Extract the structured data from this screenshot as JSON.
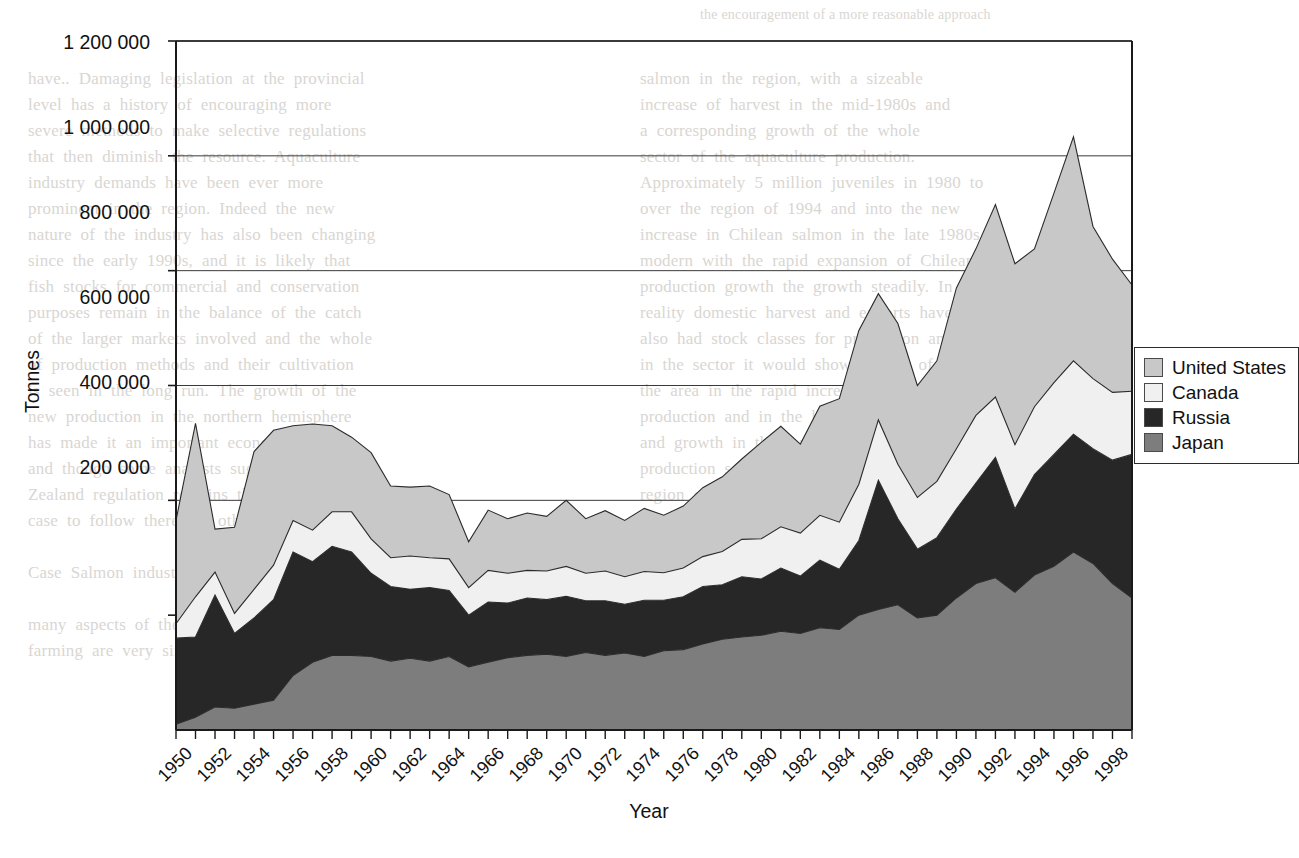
{
  "chart_data": {
    "type": "area",
    "stacked": true,
    "title": "",
    "xlabel": "Year",
    "ylabel": "Tonnes",
    "ylim": [
      0,
      1200000
    ],
    "ytick_labels": [
      "1 200 000",
      "1 000 000",
      "800 000",
      "600 000",
      "400 000",
      "200 000"
    ],
    "ytick_values": [
      1200000,
      1000000,
      800000,
      600000,
      400000,
      200000
    ],
    "grid": true,
    "legend_position": "right-upper",
    "x": [
      1950,
      1951,
      1952,
      1953,
      1954,
      1955,
      1956,
      1957,
      1958,
      1959,
      1960,
      1961,
      1962,
      1963,
      1964,
      1965,
      1966,
      1967,
      1968,
      1969,
      1970,
      1971,
      1972,
      1973,
      1974,
      1975,
      1976,
      1977,
      1978,
      1979,
      1980,
      1981,
      1982,
      1983,
      1984,
      1985,
      1986,
      1987,
      1988,
      1989,
      1990,
      1991,
      1992,
      1993,
      1994,
      1995,
      1996,
      1997,
      1998,
      1999
    ],
    "xtick_labels": [
      "1950",
      "1952",
      "1954",
      "1956",
      "1958",
      "1960",
      "1962",
      "1964",
      "1966",
      "1968",
      "1970",
      "1972",
      "1974",
      "1976",
      "1978",
      "1980",
      "1982",
      "1984",
      "1986",
      "1988",
      "1990",
      "1992",
      "1994",
      "1996",
      "1998"
    ],
    "series": [
      {
        "name": "Japan",
        "color": "#7d7d7d",
        "values": [
          10000,
          22000,
          40000,
          38000,
          45000,
          52000,
          95000,
          118000,
          130000,
          130000,
          128000,
          120000,
          125000,
          120000,
          128000,
          110000,
          118000,
          126000,
          130000,
          132000,
          128000,
          135000,
          130000,
          134000,
          128000,
          138000,
          140000,
          150000,
          158000,
          162000,
          165000,
          172000,
          168000,
          178000,
          175000,
          200000,
          210000,
          218000,
          195000,
          200000,
          230000,
          255000,
          265000,
          240000,
          270000,
          285000,
          310000,
          290000,
          255000,
          230000
        ]
      },
      {
        "name": "Russia",
        "color": "#272727",
        "values": [
          150000,
          140000,
          195000,
          130000,
          150000,
          175000,
          215000,
          175000,
          190000,
          180000,
          145000,
          130000,
          120000,
          128000,
          115000,
          90000,
          105000,
          95000,
          100000,
          95000,
          105000,
          90000,
          95000,
          85000,
          98000,
          88000,
          92000,
          100000,
          95000,
          105000,
          98000,
          110000,
          100000,
          118000,
          105000,
          130000,
          225000,
          150000,
          120000,
          135000,
          155000,
          175000,
          210000,
          145000,
          175000,
          195000,
          205000,
          200000,
          215000,
          250000
        ]
      },
      {
        "name": "Canada",
        "color": "#f0f0f0",
        "values": [
          25000,
          70000,
          40000,
          35000,
          50000,
          60000,
          55000,
          55000,
          60000,
          70000,
          60000,
          50000,
          58000,
          52000,
          55000,
          48000,
          55000,
          52000,
          48000,
          50000,
          52000,
          48000,
          52000,
          48000,
          50000,
          48000,
          50000,
          52000,
          58000,
          65000,
          70000,
          72000,
          75000,
          78000,
          82000,
          98000,
          105000,
          95000,
          90000,
          98000,
          105000,
          118000,
          105000,
          112000,
          118000,
          125000,
          128000,
          122000,
          118000,
          110000
        ]
      },
      {
        "name": "United States",
        "color": "#c8c8c8",
        "values": [
          180000,
          302000,
          75000,
          150000,
          240000,
          235000,
          165000,
          185000,
          150000,
          130000,
          150000,
          125000,
          120000,
          125000,
          112000,
          80000,
          105000,
          95000,
          100000,
          95000,
          115000,
          95000,
          105000,
          98000,
          110000,
          100000,
          108000,
          120000,
          130000,
          140000,
          168000,
          175000,
          155000,
          190000,
          215000,
          268000,
          220000,
          245000,
          195000,
          210000,
          280000,
          290000,
          335000,
          315000,
          275000,
          330000,
          390000,
          265000,
          232000,
          185000
        ]
      }
    ]
  },
  "legend": {
    "items": [
      {
        "label": "United States",
        "color": "#c8c8c8"
      },
      {
        "label": "Canada",
        "color": "#f0f0f0"
      },
      {
        "label": "Russia",
        "color": "#272727"
      },
      {
        "label": "Japan",
        "color": "#7d7d7d"
      }
    ]
  },
  "page_bleed": {
    "top_line": "the encouragement of a more reasonable approach",
    "col_left": [
      "have..  Damaging  legislation  at  the  provincial",
      "level  has  a  history  of  encouraging  more",
      "severe  methods  to  make  selective  regulations",
      "that  then  diminish  the  resource.  Aquaculture",
      "industry  demands  have  been  ever  more",
      "prominent  in  the  region.  Indeed  the  new",
      "nature  of  the  industry  has  also  been  changing",
      "since  the  early  1990s,  and  it  is  likely  that",
      "fish  stocks  for  commercial  and  conservation",
      "purposes  remain  in  the  balance  of  the  catch",
      "of  the  larger  markets  involved  and  the  whole",
      "of  production  methods  and  their  cultivation",
      "is  seen  in  the  long  run.  The  growth  of  the",
      "new  production  in  the  northern  hemisphere",
      "has  made  it  an  important  economic  sector",
      "and  though  some  analysts  suggest  that  New",
      "Zealand  regulation  remains  the  standard",
      "case  to  follow  there  are  others  who  do  not.",
      "",
      "Case  Salmon  industry  of  Chile",
      "",
      "many  aspects  of  the  history  of  salmonid",
      "farming  are  very  similar  to  that  of  other"
    ],
    "col_right": [
      "salmon  in  the  region,  with  a  sizeable",
      "increase  of  harvest  in  the  mid-1980s  and",
      "a  corresponding  growth  of  the  whole",
      "sector  of  the  aquaculture  production.",
      "Approximately  5  million  juveniles  in  1980  to",
      "over  the  region  of  1994  and  into  the  new",
      "increase  in  Chilean  salmon  in  the  late  1980s",
      "modern  with  the  rapid  expansion  of  Chilean",
      "production  growth  the  growth  steadily.  In",
      "reality  domestic  harvest  and  exports  have",
      "also  had  stock  classes  for  production  and",
      "in  the  sector  it  would  show  growth  of",
      "the  area  in  the  rapid  increase  in  the",
      "production  and  in  the  hemisphere  sector",
      "and  growth  in  the  market  and  related  to",
      "production  sectors  and  the  result  in  the",
      "region  of  the  whole  industry  changes.  The",
      "sector  and  the  related  production  in",
      "the  region  of  the  market  and  its  growth",
      "rate  as  shown  in  the  sector  since  it  is  at",
      "a  level  since  it  is  now  reports  all  other"
    ]
  }
}
